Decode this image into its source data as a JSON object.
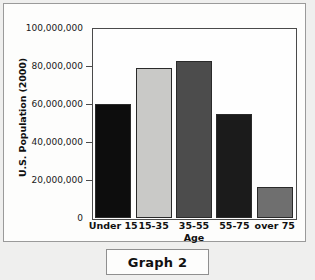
{
  "caption": {
    "label": "Graph 2"
  },
  "chart_data": {
    "type": "bar",
    "title": "Graph 2",
    "xlabel": "Age",
    "ylabel": "U.S. Population (2000)",
    "categories": [
      "Under 15",
      "15-35",
      "35-55",
      "55-75",
      "over 75"
    ],
    "values": [
      60000000,
      79000000,
      82500000,
      55000000,
      16500000
    ],
    "ylim": [
      0,
      100000000
    ],
    "ytick_labels": [
      "100,000,000",
      "80,000,000",
      "60,000,000",
      "40,000,000",
      "20,000,000",
      "0"
    ],
    "ytick_values": [
      100000000,
      80000000,
      60000000,
      40000000,
      20000000,
      0
    ],
    "grid": false,
    "legend": "none",
    "bar_colors": [
      "#0d0d0d",
      "#c9c9c7",
      "#4c4c4c",
      "#1b1b1b",
      "#6f6f6f"
    ]
  }
}
